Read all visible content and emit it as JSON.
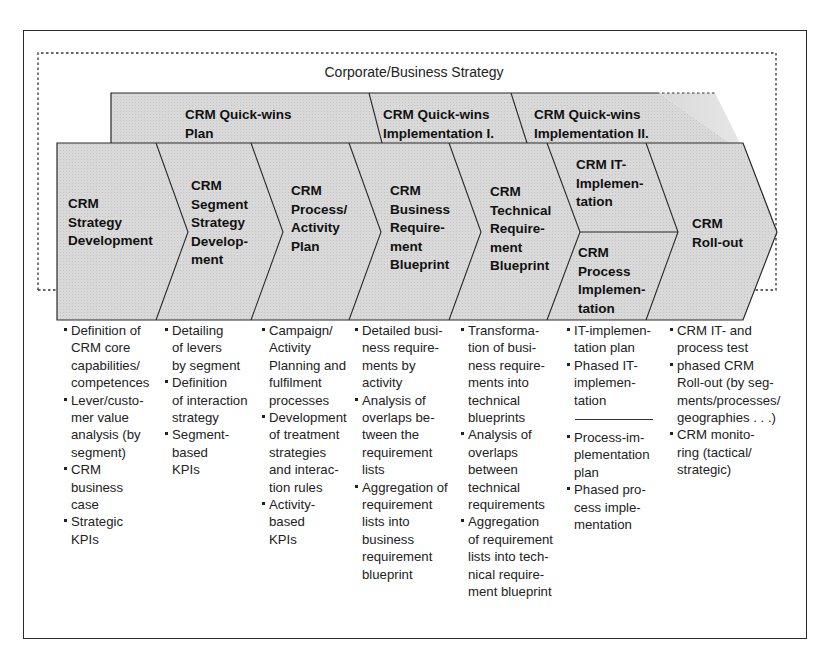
{
  "diagram": {
    "outer_label": "Corporate/Business Strategy",
    "colors": {
      "fill": "#d6d6d6",
      "stroke": "#2a2a2a",
      "text": "#111111"
    },
    "quick_wins": [
      {
        "label": "CRM Quick-wins\nPlan"
      },
      {
        "label": "CRM Quick-wins\nImplementation I."
      },
      {
        "label": "CRM Quick-wins\nImplementation II."
      }
    ],
    "phases": [
      {
        "label": "CRM\nStrategy\nDevelopment"
      },
      {
        "label": "CRM\nSegment\nStrategy\nDevelop-\nment"
      },
      {
        "label": "CRM\nProcess/\nActivity\nPlan"
      },
      {
        "label": "CRM\nBusiness\nRequire-\nment\nBlueprint"
      },
      {
        "label": "CRM\nTechnical\nRequire-\nment\nBlueprint"
      },
      {
        "label": "CRM IT-\nImplemen-\ntation"
      },
      {
        "label": "CRM\nProcess\nImplemen-\ntation"
      },
      {
        "label": "CRM\nRoll-out"
      }
    ],
    "activities": [
      {
        "items": [
          "Definition of\nCRM core\ncapabilities/\ncompetences",
          "Lever/custo-\nmer value\nanalysis (by\nsegment)",
          "CRM\nbusiness\ncase",
          "Strategic\nKPIs"
        ]
      },
      {
        "items": [
          "Detailing\nof levers\nby segment",
          "Definition\nof interaction\nstrategy",
          "Segment-\nbased\nKPIs"
        ]
      },
      {
        "items": [
          "Campaign/\nActivity\nPlanning and\nfulfilment\nprocesses",
          "Development\nof treatment\nstrategies\nand interac-\ntion rules",
          "Activity-\nbased\nKPIs"
        ]
      },
      {
        "items": [
          "Detailed busi-\nness require-\nments by\nactivity",
          "Analysis of\noverlaps be-\ntween the\nrequirement\nlists",
          "Aggregation of\nrequirement\nlists into\nbusiness\nrequirement\nblueprint"
        ]
      },
      {
        "items": [
          "Transforma-\ntion of busi-\nness require-\nments into\ntechnical\nblueprints",
          "Analysis of\noverlaps\nbetween\ntechnical\nrequirements",
          "Aggregation\nof requirement\nlists into tech-\nnical require-\nment blueprint"
        ]
      },
      {
        "items_top": [
          "IT-implemen-\ntation plan",
          "Phased IT-\nimplemen-\ntation"
        ],
        "items_bottom": [
          "Process-im-\nplementation\nplan",
          "Phased pro-\ncess imple-\nmentation"
        ]
      },
      {
        "items": [
          "CRM IT- and\nprocess test",
          "phased CRM\nRoll-out (by seg-\nments/processes/\ngeographies . . .)",
          "CRM monito-\nring (tactical/\nstrategic)"
        ]
      }
    ]
  }
}
